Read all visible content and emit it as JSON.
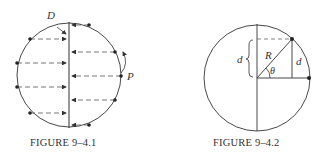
{
  "figures": [
    {
      "caption": "FIGURE 9–4.1",
      "labels": {
        "top": "D",
        "right": "P"
      }
    },
    {
      "caption": "FIGURE 9–4.2",
      "labels": {
        "radius": "R",
        "angle": "θ",
        "left_distance": "d",
        "right_distance": "d"
      }
    }
  ],
  "colors": {
    "line": "#333333",
    "dashed": "#555555",
    "background": "#ffffff"
  }
}
